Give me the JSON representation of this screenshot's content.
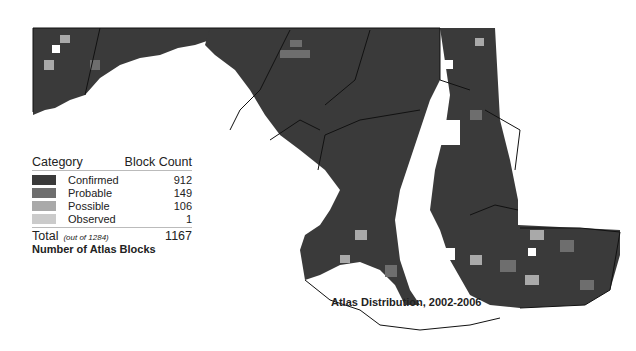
{
  "legend": {
    "header_category": "Category",
    "header_count": "Block Count",
    "items": [
      {
        "label": "Confirmed",
        "count": "912",
        "color": "#3a3a3a"
      },
      {
        "label": "Probable",
        "count": "149",
        "color": "#6e6e6e"
      },
      {
        "label": "Possible",
        "count": "106",
        "color": "#a9a9a9"
      },
      {
        "label": "Observed",
        "count": "1",
        "color": "#cbcbcb"
      }
    ],
    "total_label": "Total",
    "total_sub": "(out of 1284)",
    "total_count": "1167",
    "title": "Number of Atlas Blocks"
  },
  "map": {
    "title": "Atlas Distribution, 2002-2006",
    "region": "Maryland atlas blocks"
  }
}
